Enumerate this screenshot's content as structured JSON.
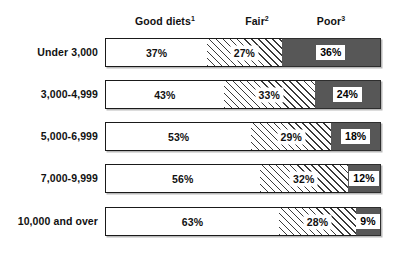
{
  "chart_data": {
    "type": "bar",
    "subtype": "stacked-horizontal-100",
    "title": "",
    "xlabel": "",
    "ylabel": "",
    "xlim": [
      0,
      100
    ],
    "grid": false,
    "legend_position": "top-as-column-headers",
    "categories": [
      "Under 3,000",
      "3,000-4,999",
      "5,000-6,999",
      "7,000-9,999",
      "10,000 and over"
    ],
    "series": [
      {
        "name": "Good diets",
        "footnote": "1",
        "values": [
          37,
          43,
          53,
          56,
          63
        ]
      },
      {
        "name": "Fair",
        "footnote": "2",
        "values": [
          27,
          33,
          29,
          32,
          28
        ]
      },
      {
        "name": "Poor",
        "footnote": "3",
        "values": [
          36,
          24,
          18,
          12,
          9
        ]
      }
    ],
    "value_labels": [
      [
        "37%",
        "27%",
        "36%"
      ],
      [
        "43%",
        "33%",
        "24%"
      ],
      [
        "53%",
        "29%",
        "18%"
      ],
      [
        "56%",
        "32%",
        "12%"
      ],
      [
        "63%",
        "28%",
        "9%"
      ]
    ],
    "colors": {
      "good": "#ffffff",
      "fair": "#ffffff",
      "fair_hatch": "#3a3a3a",
      "poor": "#575757",
      "outline": "#1a1a1a",
      "text": "#111111"
    }
  },
  "headers": {
    "good": "Good diets",
    "good_sup": "1",
    "fair": "Fair",
    "fair_sup": "2",
    "poor": "Poor",
    "poor_sup": "3"
  },
  "rows": [
    {
      "label": "Under 3,000",
      "good": 37,
      "fair": 27,
      "poor": 36,
      "good_label": "37%",
      "fair_label": "27%",
      "poor_label": "36%"
    },
    {
      "label": "3,000-4,999",
      "good": 43,
      "fair": 33,
      "poor": 24,
      "good_label": "43%",
      "fair_label": "33%",
      "poor_label": "24%"
    },
    {
      "label": "5,000-6,999",
      "good": 53,
      "fair": 29,
      "poor": 18,
      "good_label": "53%",
      "fair_label": "29%",
      "poor_label": "18%"
    },
    {
      "label": "7,000-9,999",
      "good": 56,
      "fair": 32,
      "poor": 12,
      "good_label": "56%",
      "fair_label": "32%",
      "poor_label": "12%"
    },
    {
      "label": "10,000 and over",
      "good": 63,
      "fair": 28,
      "poor": 9,
      "good_label": "63%",
      "fair_label": "28%",
      "poor_label": "9%"
    }
  ]
}
